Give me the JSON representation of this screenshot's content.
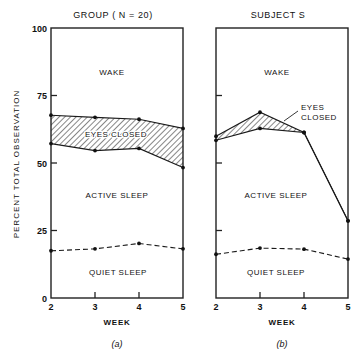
{
  "chart_data": [
    {
      "type": "area",
      "title": "GROUP ( N = 20)",
      "panel_label": "(a)",
      "xlabel": "WEEK",
      "ylabel": "PERCENT TOTAL OBSERVATION",
      "x": [
        2,
        3,
        4,
        5
      ],
      "xticks": [
        "2",
        "3",
        "4",
        "5"
      ],
      "yticks": [
        "0",
        "25",
        "50",
        "75",
        "100"
      ],
      "ylim": [
        0,
        100
      ],
      "grid": false,
      "series": [
        {
          "name": "Wake / Eyes closed boundary",
          "style": "solid",
          "values": [
            67.7,
            66.9,
            66.2,
            62.8
          ]
        },
        {
          "name": "Eyes closed / Active sleep boundary",
          "style": "solid",
          "values": [
            57.2,
            54.6,
            55.4,
            48.3
          ]
        },
        {
          "name": "Active sleep / Quiet sleep boundary",
          "style": "dashed",
          "values": [
            17.5,
            18.2,
            20.2,
            18.2
          ]
        }
      ],
      "regions": [
        {
          "name": "WAKE"
        },
        {
          "name": "EYES CLOSED",
          "hatched": true
        },
        {
          "name": "ACTIVE SLEEP"
        },
        {
          "name": "QUIET SLEEP"
        }
      ]
    },
    {
      "type": "area",
      "title": "SUBJECT S",
      "panel_label": "(b)",
      "xlabel": "WEEK",
      "ylabel": "",
      "x": [
        2,
        3,
        4,
        5
      ],
      "xticks": [
        "2",
        "3",
        "4",
        "5"
      ],
      "yticks": [],
      "ylim": [
        0,
        100
      ],
      "grid": false,
      "series": [
        {
          "name": "Wake / Eyes closed boundary",
          "style": "solid",
          "values": [
            59.9,
            68.8,
            61.3,
            28.6
          ]
        },
        {
          "name": "Eyes closed / Active sleep boundary",
          "style": "solid",
          "values": [
            58.4,
            62.8,
            61.3,
            28.6
          ]
        },
        {
          "name": "Active sleep / Quiet sleep boundary",
          "style": "dashed",
          "values": [
            16.2,
            18.5,
            18.1,
            14.4
          ]
        }
      ],
      "regions": [
        {
          "name": "WAKE"
        },
        {
          "name": "EYES CLOSED",
          "hatched": true,
          "label_lines": [
            "EYES",
            "CLOSED"
          ]
        },
        {
          "name": "ACTIVE SLEEP"
        },
        {
          "name": "QUIET SLEEP"
        }
      ]
    }
  ]
}
